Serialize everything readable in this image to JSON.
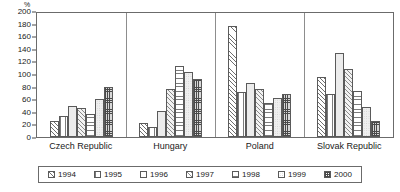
{
  "chart_data": {
    "type": "bar",
    "title": "",
    "subtitle": "",
    "xlabel": "",
    "ylabel": "%",
    "unit_label": "%",
    "ylim": [
      0,
      200
    ],
    "ytick_step": 20,
    "yticks": [
      "200",
      "180",
      "160",
      "140",
      "120",
      "100",
      "80",
      "60",
      "40",
      "20",
      "0"
    ],
    "ytick_values": [
      200,
      180,
      160,
      140,
      120,
      100,
      80,
      60,
      40,
      20,
      0
    ],
    "grid": false,
    "legend_position": "bottom",
    "categories": [
      "Czech Republic",
      "Hungary",
      "Poland",
      "Slovak Republic"
    ],
    "series": [
      {
        "name": "1994",
        "pattern": "diagonal-hatch-up",
        "values": [
          26,
          22,
          176,
          95
        ]
      },
      {
        "name": "1995",
        "pattern": "vertical-lines",
        "values": [
          33,
          16,
          72,
          68
        ]
      },
      {
        "name": "1996",
        "pattern": "light-stipple",
        "values": [
          49,
          41,
          85,
          133
        ]
      },
      {
        "name": "1997",
        "pattern": "diagonal-hatch-up-light",
        "values": [
          46,
          76,
          77,
          108
        ]
      },
      {
        "name": "1998",
        "pattern": "horizontal-lines",
        "values": [
          37,
          113,
          54,
          73
        ]
      },
      {
        "name": "1999",
        "pattern": "light-stipple-wide",
        "values": [
          61,
          103,
          62,
          48
        ]
      },
      {
        "name": "2000",
        "pattern": "cross-hatch-grid",
        "values": [
          80,
          92,
          69,
          25
        ]
      }
    ]
  },
  "legend": {
    "items": [
      {
        "label": "1994"
      },
      {
        "label": "1995"
      },
      {
        "label": "1996"
      },
      {
        "label": "1997"
      },
      {
        "label": "1998"
      },
      {
        "label": "1999"
      },
      {
        "label": "2000"
      }
    ]
  },
  "colors": {
    "frame": "#6b6b6b",
    "bar_outline": "#5a5a5a",
    "hatch": "#6e6e6e",
    "text": "#1a1a1a",
    "background": "#ffffff"
  }
}
